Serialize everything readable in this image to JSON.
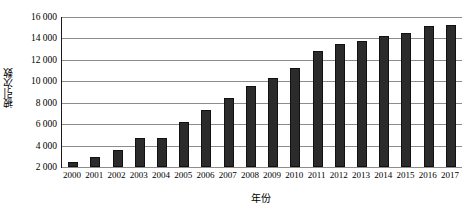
{
  "chart_data": {
    "type": "bar",
    "title": "",
    "xlabel": "年份",
    "ylabel": "被引次数",
    "categories": [
      "2000",
      "2001",
      "2002",
      "2003",
      "2004",
      "2005",
      "2006",
      "2007",
      "2008",
      "2009",
      "2010",
      "2011",
      "2012",
      "2013",
      "2014",
      "2015",
      "2016",
      "2017"
    ],
    "values": [
      2500,
      2900,
      3600,
      4700,
      4700,
      6200,
      7300,
      8400,
      9600,
      10300,
      11200,
      12800,
      13500,
      13800,
      14200,
      14500,
      15200,
      15300
    ],
    "ylim": [
      2000,
      16000
    ],
    "ytick_step": 2000,
    "ytick_labels": [
      "16 000",
      "14 000",
      "12 000",
      "10 000",
      "8 000",
      "6 000",
      "4 000",
      "2 000"
    ],
    "ytick_values": [
      16000,
      14000,
      12000,
      10000,
      8000,
      6000,
      4000,
      2000
    ],
    "grid": true,
    "legend": "none",
    "bar_color": "#2b2b2b",
    "grid_color": "#8c8c8c",
    "axis_color": "#1a1a1a"
  }
}
